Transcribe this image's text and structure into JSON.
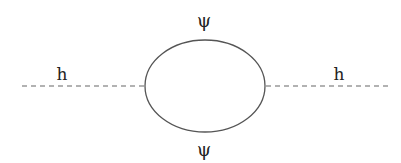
{
  "diagram": {
    "type": "feynman-diagram",
    "colors": {
      "line": "#555555",
      "dash": "#666666",
      "text": "#222222",
      "background": "#ffffff"
    },
    "external_lines": [
      {
        "id": "left",
        "label": "h",
        "style": "dashed",
        "x1": 22,
        "y1": 86,
        "x2": 145,
        "y2": 86
      },
      {
        "id": "right",
        "label": "h",
        "style": "dashed",
        "x1": 266,
        "y1": 86,
        "x2": 388,
        "y2": 86
      }
    ],
    "loop": {
      "shape": "ellipse",
      "cx": 205,
      "cy": 86,
      "rx": 60,
      "ry": 46,
      "style": "solid"
    },
    "labels": {
      "left_h": "h",
      "right_h": "h",
      "top_psi": "ψ",
      "bottom_psi": "ψ"
    }
  }
}
